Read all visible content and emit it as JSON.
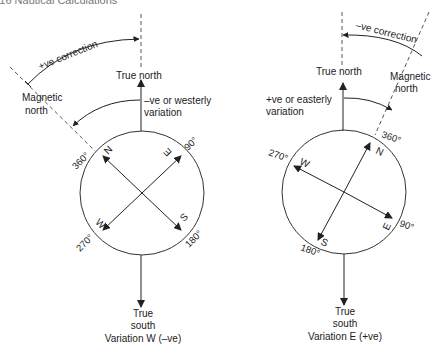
{
  "header": {
    "text": "116     Nautical Calculations"
  },
  "colors": {
    "ink": "#222222",
    "paper": "#ffffff",
    "header": "#777777"
  },
  "left_diagram": {
    "caption_line1": "True",
    "caption_line2": "south",
    "caption_line3": "Variation W (–ve)",
    "true_north": "True north",
    "magnetic_north_line1": "Magnetic",
    "magnetic_north_line2": "north",
    "correction": "+ve correction",
    "variation_line1": "–ve or westerly",
    "variation_line2": "variation",
    "cardinals": {
      "n": "N",
      "e": "E",
      "s": "S",
      "w": "W"
    },
    "degrees": {
      "d360": "360°",
      "d90": "90°",
      "d180": "180°",
      "d270": "270°"
    }
  },
  "right_diagram": {
    "caption_line1": "True",
    "caption_line2": "south",
    "caption_line3": "Variation E (+ve)",
    "true_north": "True north",
    "magnetic_north_line1": "Magnetic",
    "magnetic_north_line2": "north",
    "correction": "–ve correction",
    "variation_line1": "+ve or easterly",
    "variation_line2": "variation",
    "cardinals": {
      "n": "N",
      "e": "E",
      "s": "S",
      "w": "W"
    },
    "degrees": {
      "d360": "360°",
      "d90": "90°",
      "d180": "180°",
      "d270": "270°"
    }
  }
}
